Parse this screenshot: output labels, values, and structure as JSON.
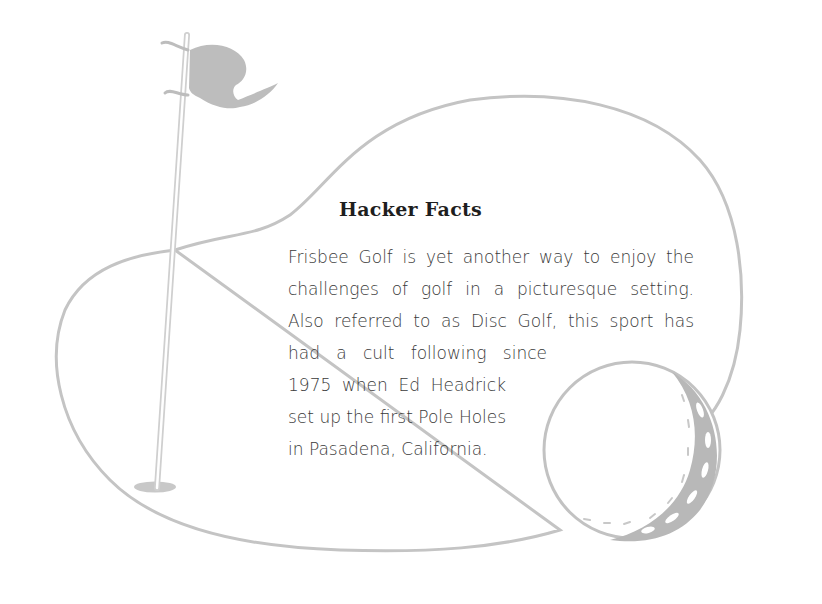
{
  "fact_box": {
    "title": "Hacker Facts",
    "lines_full_width": [
      "Frisbee Golf is yet another way to enjoy the",
      "challenges of golf in a picturesque setting.",
      "Also referred to as Disc Golf, this sport has"
    ],
    "lines_wrapped": [
      "had a cult following since",
      "1975 when Ed Headrick",
      "set up the first Pole Holes",
      "in Pasadena, California."
    ]
  },
  "illustration": {
    "elements": [
      "golf-green-outline",
      "flagstick",
      "flag",
      "cup-hole",
      "golf-ball"
    ],
    "colors": {
      "outline": "#c4c4c4",
      "flag_fill": "#bdbdbd",
      "ball_shadow": "#b8b8b8",
      "text": "#3a3a3a",
      "title": "#1e1e1e"
    }
  }
}
